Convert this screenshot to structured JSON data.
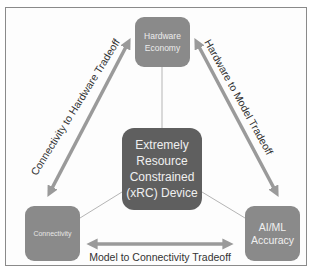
{
  "diagram": {
    "center_node": {
      "lines": [
        "Extremely",
        "Resource",
        "Constrained",
        "(xRC) Device"
      ]
    },
    "nodes": {
      "hardware": {
        "lines": [
          "Hardware",
          "Economy"
        ]
      },
      "connectivity": {
        "lines": [
          "Connectivity"
        ]
      },
      "ai_ml": {
        "lines": [
          "AI/ML",
          "Accuracy"
        ]
      }
    },
    "tradeoffs": {
      "connectivity_hardware": "Connectivity to Hardware Tradeoff",
      "hardware_model": "Hardware to Model Tradeoff",
      "model_connectivity": "Model to Connectivity Tradeoff"
    },
    "colors": {
      "outer_node": "#8a8a8a",
      "center_node": "#5f5f5f",
      "arrow": "#9a9a9a",
      "connector": "#b0b0b0",
      "frame": "#8a8a8a"
    }
  }
}
